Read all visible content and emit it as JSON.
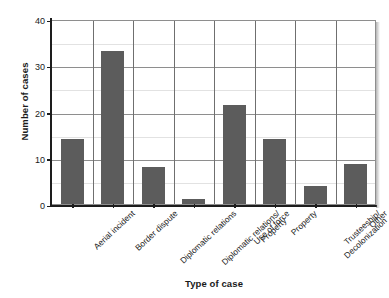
{
  "chart_data": {
    "type": "bar",
    "title": "",
    "xlabel": "Type of case",
    "ylabel": "Number of cases",
    "categories": [
      "Aerial incident",
      "Border dispute",
      "Diplomatic relations",
      "Diplomatic relations/\nProperty",
      "Use of force",
      "Property",
      "Trusteeship/\nDecolonization",
      "Other"
    ],
    "values": [
      14,
      33,
      8,
      1,
      21.5,
      14,
      4,
      8.7
    ],
    "ylim": [
      0,
      40
    ],
    "yticks": [
      0,
      10,
      20,
      30,
      40
    ],
    "ytick_labels": [
      "0",
      "10",
      "20",
      "30",
      "40"
    ],
    "minor_yticks": [
      5,
      15,
      25,
      35
    ],
    "grid": "both",
    "legend": "none",
    "bar_color": "#5c5c5c",
    "axis_color": "#1d1d1d",
    "gridline_major_color": "#8e8e8e",
    "gridline_minor_color": "#e2e2e2",
    "background_color": "#ffffff"
  }
}
